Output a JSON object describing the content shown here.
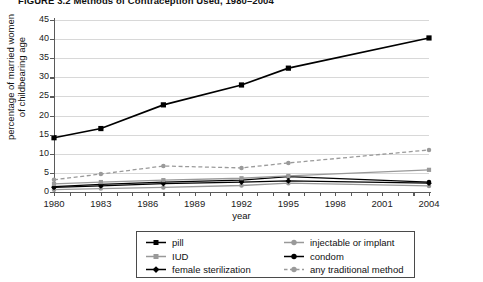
{
  "figure": {
    "title": "FIGURE 3.2 Methods of Contraception Used, 1980–2004"
  },
  "chart_data": {
    "type": "line",
    "title": "FIGURE 3.2 Methods of Contraception Used, 1980–2004",
    "xlabel": "year",
    "ylabel": "percentage of married women of childbearing age",
    "xlim": [
      1980,
      2004
    ],
    "ylim": [
      0,
      45
    ],
    "ytick_step": 5,
    "yticks": [
      0,
      5,
      10,
      15,
      20,
      25,
      30,
      35,
      40,
      45
    ],
    "xticks": [
      1980,
      1983,
      1986,
      1989,
      1992,
      1995,
      1998,
      2001,
      2004
    ],
    "grid": "horizontal",
    "legend_position": "below-center",
    "x": [
      1980,
      1983,
      1987,
      1992,
      1995,
      2004
    ],
    "series": [
      {
        "name": "pill",
        "color": "#000000",
        "marker": "square",
        "dash": "solid",
        "values": [
          14.2,
          16.6,
          22.8,
          28.0,
          32.4,
          40.3
        ]
      },
      {
        "name": "IUD",
        "color": "#999999",
        "marker": "square",
        "dash": "solid",
        "values": [
          2.1,
          2.6,
          3.1,
          3.6,
          4.2,
          5.8
        ]
      },
      {
        "name": "female sterilization",
        "color": "#000000",
        "marker": "diamond",
        "dash": "solid",
        "values": [
          1.2,
          1.6,
          2.2,
          2.6,
          2.9,
          2.3
        ]
      },
      {
        "name": "injectable or implant",
        "color": "#999999",
        "marker": "circle",
        "dash": "solid",
        "values": [
          0.6,
          0.9,
          1.2,
          1.7,
          2.3,
          1.6
        ]
      },
      {
        "name": "condom",
        "color": "#000000",
        "marker": "circle",
        "dash": "solid",
        "values": [
          1.4,
          2.0,
          2.6,
          3.1,
          4.0,
          2.6
        ]
      },
      {
        "name": "any traditional method",
        "color": "#9a9a9a",
        "marker": "circle",
        "dash": "dashed",
        "values": [
          3.2,
          4.7,
          6.8,
          6.3,
          7.6,
          11.0
        ]
      }
    ]
  },
  "axes": {
    "y_title_line1": "percentage of married women",
    "y_title_line2": "of childbearing age",
    "x_title": "year"
  },
  "legend": {
    "left_column": [
      {
        "label": "pill",
        "marker": "square",
        "color": "#000000",
        "dash": "solid"
      },
      {
        "label": "IUD",
        "marker": "square",
        "color": "#999999",
        "dash": "solid"
      },
      {
        "label": "female sterilization",
        "marker": "diamond",
        "color": "#000000",
        "dash": "solid"
      }
    ],
    "right_column": [
      {
        "label": "injectable or implant",
        "marker": "circle",
        "color": "#999999",
        "dash": "solid"
      },
      {
        "label": "condom",
        "marker": "circle",
        "color": "#000000",
        "dash": "solid"
      },
      {
        "label": "any traditional method",
        "marker": "circle",
        "color": "#9a9a9a",
        "dash": "dashed"
      }
    ]
  }
}
